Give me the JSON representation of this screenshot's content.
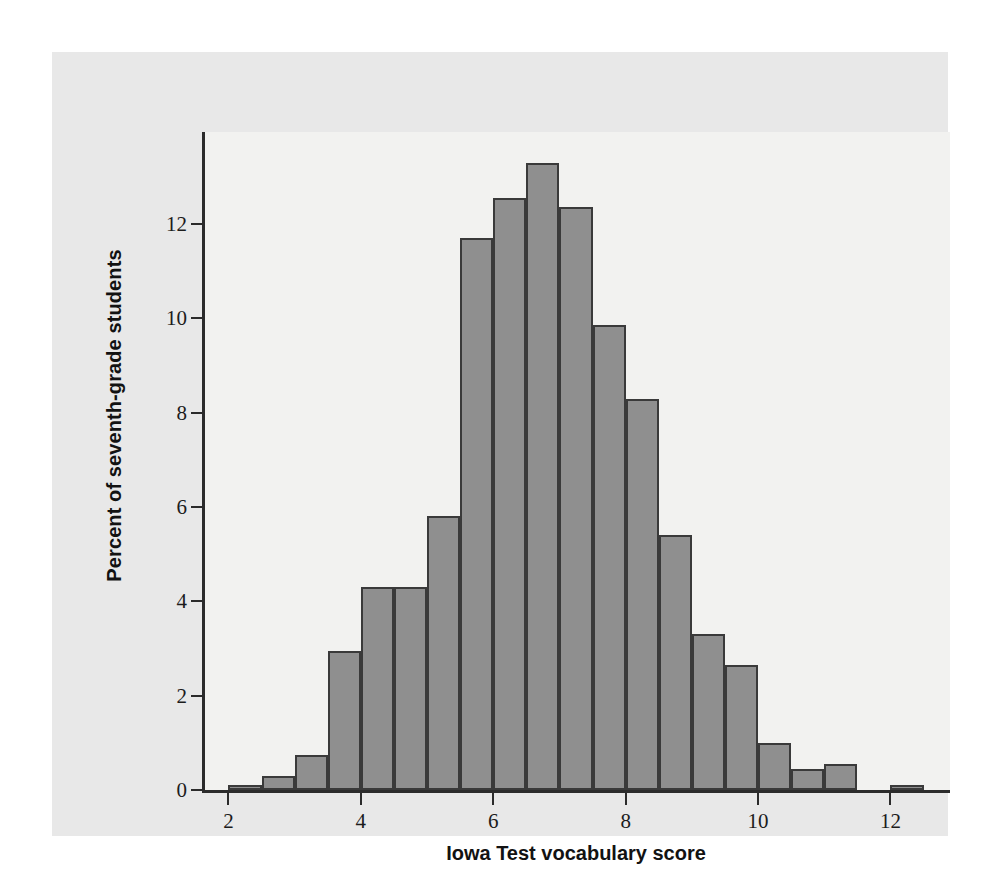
{
  "figure": {
    "background_color": "#e8e8e8",
    "plot_background_color": "#f2f2f0",
    "bar_fill_color": "#8f8f8f",
    "bar_edge_color": "#3a3a3a",
    "axis_color": "#2b2b2b"
  },
  "chart_data": {
    "type": "bar",
    "subtype": "histogram",
    "title": "",
    "xlabel": "Iowa Test vocabulary score",
    "ylabel": "Percent of seventh-grade students",
    "xlim": [
      1.6,
      12.9
    ],
    "ylim": [
      0,
      13.95
    ],
    "grid": false,
    "legend": null,
    "bin_width": 0.5,
    "xticks": [
      2,
      4,
      6,
      8,
      10,
      12
    ],
    "xtick_labels": [
      "2",
      "4",
      "6",
      "8",
      "10",
      "12"
    ],
    "yticks": [
      0,
      2,
      4,
      6,
      8,
      10,
      12
    ],
    "ytick_labels": [
      "0",
      "2",
      "4",
      "6",
      "8",
      "10",
      "12"
    ],
    "bins": [
      {
        "left": 2.0,
        "right": 2.5,
        "value": 0.1
      },
      {
        "left": 2.5,
        "right": 3.0,
        "value": 0.3
      },
      {
        "left": 3.0,
        "right": 3.5,
        "value": 0.75
      },
      {
        "left": 3.5,
        "right": 4.0,
        "value": 2.95
      },
      {
        "left": 4.0,
        "right": 4.5,
        "value": 4.3
      },
      {
        "left": 4.5,
        "right": 5.0,
        "value": 4.3
      },
      {
        "left": 5.0,
        "right": 5.5,
        "value": 5.8
      },
      {
        "left": 5.5,
        "right": 6.0,
        "value": 11.7
      },
      {
        "left": 6.0,
        "right": 6.5,
        "value": 12.55
      },
      {
        "left": 6.5,
        "right": 7.0,
        "value": 13.3
      },
      {
        "left": 7.0,
        "right": 7.5,
        "value": 12.35
      },
      {
        "left": 7.5,
        "right": 8.0,
        "value": 9.85
      },
      {
        "left": 8.0,
        "right": 8.5,
        "value": 8.3
      },
      {
        "left": 8.5,
        "right": 9.0,
        "value": 5.4
      },
      {
        "left": 9.0,
        "right": 9.5,
        "value": 3.3
      },
      {
        "left": 9.5,
        "right": 10.0,
        "value": 2.65
      },
      {
        "left": 10.0,
        "right": 10.5,
        "value": 1.0
      },
      {
        "left": 10.5,
        "right": 11.0,
        "value": 0.45
      },
      {
        "left": 11.0,
        "right": 11.5,
        "value": 0.55
      },
      {
        "left": 12.0,
        "right": 12.5,
        "value": 0.1
      }
    ]
  }
}
